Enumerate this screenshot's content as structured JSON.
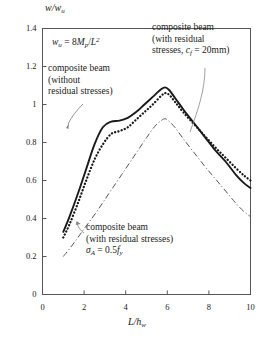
{
  "chart_data": {
    "type": "line",
    "title": "",
    "xlabel": "L/hw",
    "ylabel": "w/wu",
    "xlim": [
      0,
      10
    ],
    "ylim": [
      0,
      1.4
    ],
    "xticks": [
      "0",
      "2",
      "4",
      "6",
      "8",
      "10"
    ],
    "xtick_values": [
      0,
      2,
      4,
      6,
      8,
      10
    ],
    "yticks": [
      "0",
      "0.2",
      "0.4",
      "0.6",
      "0.8",
      "1",
      "1.2",
      "1.4"
    ],
    "ytick_values": [
      0,
      0.2,
      0.4,
      0.6,
      0.8,
      1.0,
      1.2,
      1.4
    ],
    "grid": false,
    "legend": "annotations-with-leader-lines",
    "series": [
      {
        "name": "composite beam (without residual stresses)",
        "style": "solid",
        "color": "#1a1a1a",
        "x": [
          1.0,
          1.3,
          1.7,
          2.1,
          2.5,
          2.9,
          3.3,
          3.7,
          4.1,
          4.5,
          4.9,
          5.3,
          5.7,
          5.9,
          6.1,
          6.4,
          6.8,
          7.3,
          7.8,
          8.3,
          8.8,
          9.3,
          9.7,
          10.0
        ],
        "y": [
          0.33,
          0.41,
          0.53,
          0.66,
          0.79,
          0.88,
          0.91,
          0.915,
          0.93,
          0.96,
          1.0,
          1.04,
          1.08,
          1.09,
          1.075,
          1.03,
          0.97,
          0.9,
          0.83,
          0.76,
          0.7,
          0.63,
          0.585,
          0.56
        ]
      },
      {
        "name": "composite beam (with residual stresses, cf = 20mm)",
        "style": "dotted",
        "color": "#1a1a1a",
        "x": [
          1.0,
          1.3,
          1.7,
          2.1,
          2.5,
          2.9,
          3.3,
          3.7,
          4.1,
          4.5,
          4.9,
          5.3,
          5.7,
          5.9,
          6.1,
          6.4,
          6.8,
          7.3,
          7.8,
          8.3,
          8.8,
          9.3,
          9.7,
          10.0
        ],
        "y": [
          0.3,
          0.37,
          0.48,
          0.6,
          0.71,
          0.79,
          0.845,
          0.86,
          0.88,
          0.92,
          0.96,
          1.0,
          1.045,
          1.06,
          1.05,
          1.01,
          0.955,
          0.895,
          0.835,
          0.775,
          0.72,
          0.665,
          0.625,
          0.6
        ]
      },
      {
        "name": "composite beam (with residual stresses) sigmaA = 0.5fy",
        "style": "dash-dot",
        "color": "#555555",
        "x": [
          1.0,
          1.4,
          1.8,
          2.2,
          2.6,
          3.0,
          3.4,
          3.8,
          4.2,
          4.6,
          5.0,
          5.4,
          5.7,
          5.9,
          6.1,
          6.4,
          6.8,
          7.3,
          7.8,
          8.3,
          8.8,
          9.3,
          9.7,
          10.0
        ],
        "y": [
          0.2,
          0.255,
          0.315,
          0.375,
          0.435,
          0.5,
          0.565,
          0.63,
          0.695,
          0.76,
          0.825,
          0.885,
          0.915,
          0.925,
          0.91,
          0.875,
          0.815,
          0.745,
          0.675,
          0.61,
          0.545,
          0.48,
          0.435,
          0.41
        ]
      }
    ],
    "annotations": [
      {
        "id": "formula",
        "text": "wu = 8Mp/L2",
        "role": "definition"
      },
      {
        "id": "top-right",
        "text": "composite beam (with residual stresses, cf = 20mm)",
        "role": "series-label"
      },
      {
        "id": "left",
        "text": "composite beam (without residual stresses)",
        "role": "series-label"
      },
      {
        "id": "bottom",
        "text": "composite beam (with residual stresses) σA = 0.5fy",
        "role": "series-label"
      }
    ]
  },
  "axes": {
    "y_title_main": "w",
    "y_title_slash": "/",
    "y_title_den": "w",
    "y_title_den_sub": "u",
    "x_title_num": "L",
    "x_title_slash": "/",
    "x_title_den": "h",
    "x_title_den_sub": "w"
  },
  "formula": {
    "lhs": "w",
    "lhs_sub": "u",
    "eq": " = 8",
    "m": "M",
    "m_sub": "p",
    "div": "/",
    "l": "L",
    "l_sup": "2"
  },
  "anno_top_right": {
    "line1": "composite beam",
    "line2": "(with residual",
    "line3_a": "stresses, ",
    "line3_c": "c",
    "line3_c_sub": "f",
    "line3_b": " = 20mm)"
  },
  "anno_left": {
    "line1": "composite beam",
    "line2": "(without",
    "line3": "residual stresses)"
  },
  "anno_bottom": {
    "line1": "composite beam",
    "line2": "(with residual stresses)",
    "line3_sigma": "σ",
    "line3_sigma_sub": "A",
    "line3_eq": " = 0.5",
    "line3_f": "f",
    "line3_f_sub": "y"
  },
  "colors": {
    "ink": "#1a1a1a",
    "frame": "#555555",
    "dashdot": "#555555",
    "leader": "#777777"
  }
}
